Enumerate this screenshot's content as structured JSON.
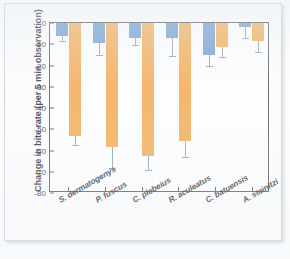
{
  "chart_data": {
    "type": "bar",
    "title": "",
    "xlabel": "",
    "ylabel": "Change in bite rate (per 5 min observation)",
    "ylim": [
      -80,
      0
    ],
    "ytick_labels": [
      "0",
      "-10",
      "-20",
      "-30",
      "-40",
      "-50",
      "-60",
      "-70",
      "-80"
    ],
    "ytick_values": [
      0,
      -10,
      -20,
      -30,
      -40,
      -50,
      -60,
      -70,
      -80
    ],
    "grid": false,
    "legend": "none",
    "orientation": "vertical",
    "categories": [
      "S. dermatogenys",
      "P. fuscus",
      "C. plebeius",
      "R. aculeatus",
      "C. batuensis",
      "A. steinitzi"
    ],
    "series": [
      {
        "name": "series-blue",
        "color": "#5b8fc7",
        "values": [
          -6.0,
          -9.5,
          -7.0,
          -7.0,
          -15.0,
          -2.0
        ],
        "error_low": [
          -8.5,
          -15.0,
          -10.5,
          -15.5,
          -20.0,
          -7.0
        ]
      },
      {
        "name": "series-orange",
        "color": "#f4a03c",
        "values": [
          -53.0,
          -58.5,
          -62.5,
          -55.5,
          -11.5,
          -8.5
        ],
        "error_low": [
          -57.5,
          -68.0,
          -69.0,
          -63.0,
          -16.0,
          -13.5
        ]
      }
    ]
  }
}
